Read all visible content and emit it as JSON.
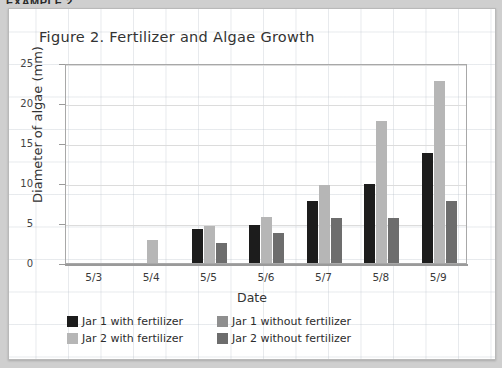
{
  "top_caption": "EXAMPLE 2",
  "chart_data": {
    "type": "bar",
    "title": "Figure 2. Fertilizer and Algae Growth",
    "xlabel": "Date",
    "ylabel": "Diameter of algae (mm)",
    "categories": [
      "5/3",
      "5/4",
      "5/5",
      "5/6",
      "5/7",
      "5/8",
      "5/9"
    ],
    "yticks": [
      0,
      5,
      10,
      15,
      20,
      25
    ],
    "ylim": [
      0,
      25
    ],
    "grid": true,
    "legend_position": "bottom-left",
    "series": [
      {
        "name": "Jar 1 with fertilizer",
        "color": "#1c1c1c",
        "values": [
          0,
          0,
          4.3,
          4.7,
          7.8,
          9.9,
          13.8
        ]
      },
      {
        "name": "Jar 1 without fertilizer",
        "color": "#8f8f8f",
        "values": [
          0,
          0,
          0,
          0,
          0,
          0,
          0
        ]
      },
      {
        "name": "Jar 2 with fertilizer",
        "color": "#b6b6b6",
        "values": [
          0,
          2.9,
          4.6,
          5.7,
          9.8,
          17.7,
          22.8
        ]
      },
      {
        "name": "Jar 2 without fertilizer",
        "color": "#6d6d6d",
        "values": [
          0,
          0,
          2.5,
          3.7,
          5.6,
          5.6,
          7.7
        ]
      }
    ]
  }
}
